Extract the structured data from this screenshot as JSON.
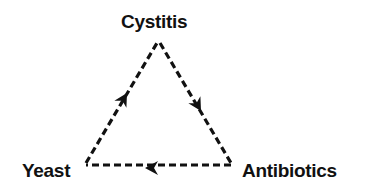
{
  "diagram": {
    "type": "cycle",
    "nodes": [
      {
        "id": "cystitis",
        "label": "Cystitis",
        "position": "top"
      },
      {
        "id": "antibiotics",
        "label": "Antibiotics",
        "position": "bottom-right"
      },
      {
        "id": "yeast",
        "label": "Yeast",
        "position": "bottom-left"
      }
    ],
    "edges": [
      {
        "from": "cystitis",
        "to": "antibiotics",
        "style": "dashed",
        "arrow": "mid"
      },
      {
        "from": "antibiotics",
        "to": "yeast",
        "style": "dashed",
        "arrow": "mid"
      },
      {
        "from": "yeast",
        "to": "cystitis",
        "style": "dashed",
        "arrow": "mid"
      }
    ],
    "colors": {
      "stroke": "#111111",
      "text": "#111111",
      "background": "#ffffff"
    }
  }
}
